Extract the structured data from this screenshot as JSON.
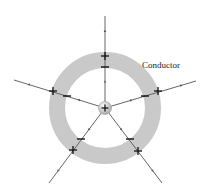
{
  "diagram": {
    "label": "Conductor",
    "colors": {
      "ring": "#c9c9c9",
      "line": "#555555",
      "charge_sign": "#111111",
      "center_fill": "#d8d8d8"
    },
    "center": {
      "x": 105,
      "y": 108,
      "charge": "+"
    },
    "ring": {
      "outer_radius": 56,
      "inner_radius": 40
    },
    "field_lines": [
      {
        "name": "top",
        "from": [
          105,
          16
        ],
        "outer_sign": "+",
        "inner_sign": "−",
        "outer_pos": [
          105,
          56
        ],
        "inner_pos": [
          105,
          67
        ]
      },
      {
        "name": "left",
        "from": [
          14,
          80
        ],
        "outer_sign": "+",
        "inner_sign": "−",
        "outer_pos": [
          53,
          91
        ],
        "inner_pos": [
          67,
          96
        ]
      },
      {
        "name": "right",
        "from": [
          196,
          81
        ],
        "outer_sign": "+",
        "inner_sign": "−",
        "outer_pos": [
          158,
          91
        ],
        "inner_pos": [
          145,
          96
        ]
      },
      {
        "name": "bottom-left",
        "from": [
          49,
          183
        ],
        "outer_sign": "+",
        "inner_sign": "−",
        "outer_pos": [
          73,
          150
        ],
        "inner_pos": [
          81,
          139
        ]
      },
      {
        "name": "bottom-right",
        "from": [
          162,
          183
        ],
        "outer_sign": "+",
        "inner_sign": "−",
        "outer_pos": [
          138,
          151
        ],
        "inner_pos": [
          130,
          139
        ]
      }
    ]
  }
}
